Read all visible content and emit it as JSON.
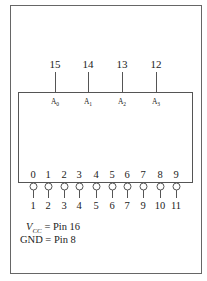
{
  "figure": {
    "type": "ic-pinout",
    "colors": {
      "line": "#555555",
      "text": "#222222",
      "background": "#ffffff"
    }
  },
  "top_pins": [
    {
      "pin": "15",
      "signal": "A",
      "sub": "0"
    },
    {
      "pin": "14",
      "signal": "A",
      "sub": "1"
    },
    {
      "pin": "13",
      "signal": "A",
      "sub": "2"
    },
    {
      "pin": "12",
      "signal": "A",
      "sub": "3"
    }
  ],
  "bottom_pins": [
    {
      "output": "0",
      "pin": "1"
    },
    {
      "output": "1",
      "pin": "2"
    },
    {
      "output": "2",
      "pin": "3"
    },
    {
      "output": "3",
      "pin": "4"
    },
    {
      "output": "4",
      "pin": "5"
    },
    {
      "output": "5",
      "pin": "6"
    },
    {
      "output": "6",
      "pin": "7"
    },
    {
      "output": "7",
      "pin": "9"
    },
    {
      "output": "8",
      "pin": "10"
    },
    {
      "output": "9",
      "pin": "11"
    }
  ],
  "notes": {
    "vcc_symbol": "V",
    "vcc_sub": "CC",
    "vcc_text": " = Pin 16",
    "gnd_text": "GND = Pin 8"
  }
}
